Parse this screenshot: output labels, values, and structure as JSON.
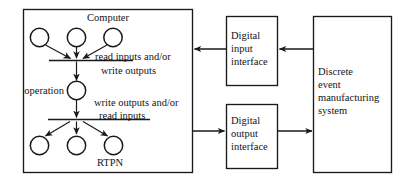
{
  "diagram": {
    "title_computer": "Computer",
    "title_rtpn": "RTPN",
    "operation_label": "operation",
    "note_upper_line1": "read inputs and/or",
    "note_upper_line2": "write outputs",
    "note_lower_line1": "write outputs and/or",
    "note_lower_line2": "read inputs",
    "digital_input": {
      "line1": "Digital",
      "line2": "input",
      "line3": "interface"
    },
    "digital_output": {
      "line1": "Digital",
      "line2": "output",
      "line3": "interface"
    },
    "des_box": {
      "line1": "Discrete",
      "line2": "event",
      "line3": "manufacturing",
      "line4": "system"
    },
    "colors": {
      "stroke": "#1a1a1a",
      "background": "#ffffff",
      "text": "#141414"
    }
  }
}
